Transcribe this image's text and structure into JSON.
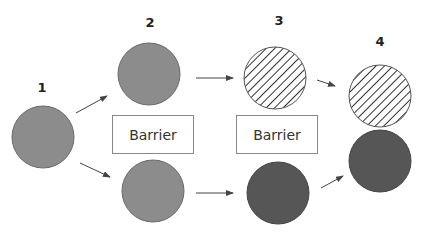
{
  "labels": {
    "stage1": "1",
    "stage2": "2",
    "stage3": "3",
    "stage4": "4"
  },
  "barriers": [
    {
      "text": "Barrier"
    },
    {
      "text": "Barrier"
    }
  ],
  "colors": {
    "light_fill": "#8c8c8c",
    "dark_fill": "#565656",
    "hatch_line": "#333333",
    "border": "#6a6a6a",
    "arrow": "#444444",
    "barrier_border": "#888888"
  },
  "nodes": [
    {
      "id": "stage1-circle",
      "fill": "light"
    },
    {
      "id": "stage2-top-circle",
      "fill": "light"
    },
    {
      "id": "stage2-bottom-circle",
      "fill": "light"
    },
    {
      "id": "stage3-top-circle",
      "fill": "hatched"
    },
    {
      "id": "stage3-bottom-circle",
      "fill": "dark"
    },
    {
      "id": "stage4-top-circle",
      "fill": "hatched"
    },
    {
      "id": "stage4-bottom-circle",
      "fill": "dark"
    }
  ]
}
